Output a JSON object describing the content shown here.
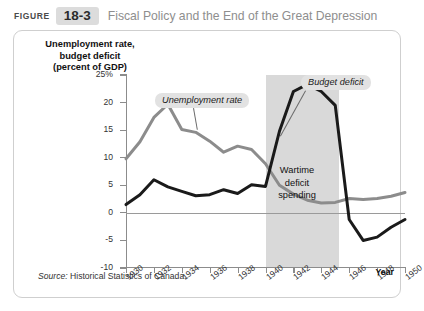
{
  "header": {
    "figure_word": "FIGURE",
    "figure_number": "18-3",
    "title": "Fiscal Policy and the End of the Great Depression"
  },
  "source": {
    "prefix": "Source:",
    "text": " Historical Statistics of Canada."
  },
  "annotations": {
    "unemployment_label": "Unemployment rate",
    "budget_label": "Budget deficit",
    "war_line1": "Wartime",
    "war_line2": "deficit",
    "war_line3": "spending"
  },
  "colors": {
    "unemployment_line": "#8c8c8c",
    "budget_line": "#1a1a1a",
    "war_band": "#d9d9d9",
    "axis": "#8c8c8c",
    "title": "#8e8e8e",
    "badge": "#dcdcdc"
  },
  "chart_data": {
    "type": "line",
    "title": "Fiscal Policy and the End of the Great Depression",
    "xlabel": "Year",
    "ylabel": "Unemployment rate, budget deficit (percent of GDP)",
    "ylabel_lines": [
      "Unemployment rate,",
      "budget deficit",
      "(percent of GDP)"
    ],
    "xlim": [
      1930,
      1950
    ],
    "ylim": [
      -10,
      25
    ],
    "ytick_labels": [
      "25%",
      "20",
      "15",
      "10",
      "5",
      "0",
      "-5",
      "-10"
    ],
    "yticks": [
      25,
      20,
      15,
      10,
      5,
      0,
      -5,
      -10
    ],
    "xticks": [
      1930,
      1932,
      1934,
      1936,
      1938,
      1940,
      1942,
      1944,
      1946,
      1948,
      1950
    ],
    "xtick_labels": [
      "1930",
      "1932",
      "1934",
      "1936",
      "1938",
      "1940",
      "1942",
      "1944",
      "1946",
      "1948",
      "1950"
    ],
    "grid": false,
    "legend": "inline-callouts",
    "shaded_region": {
      "label": "Wartime deficit spending",
      "x_start": 1940,
      "x_end": 1945.3,
      "color": "#d9d9d9"
    },
    "zero_line": 0,
    "x": [
      1930,
      1931,
      1932,
      1933,
      1934,
      1935,
      1936,
      1937,
      1938,
      1939,
      1940,
      1941,
      1942,
      1943,
      1944,
      1945,
      1946,
      1947,
      1948,
      1949,
      1950
    ],
    "series": [
      {
        "name": "Unemployment rate",
        "color": "#8c8c8c",
        "values": [
          9.8,
          12.9,
          17.3,
          19.7,
          15.1,
          14.6,
          13.0,
          11.0,
          12.1,
          11.5,
          8.9,
          5.0,
          3.4,
          2.3,
          1.8,
          1.9,
          2.6,
          2.4,
          2.6,
          3.0,
          3.7
        ]
      },
      {
        "name": "Budget deficit",
        "color": "#1a1a1a",
        "values": [
          1.5,
          3.3,
          6.0,
          4.7,
          3.9,
          3.1,
          3.3,
          4.2,
          3.5,
          5.1,
          4.8,
          14.8,
          22.0,
          23.3,
          22.0,
          19.5,
          -1.2,
          -5.0,
          -4.4,
          -2.6,
          -1.2
        ]
      }
    ]
  }
}
